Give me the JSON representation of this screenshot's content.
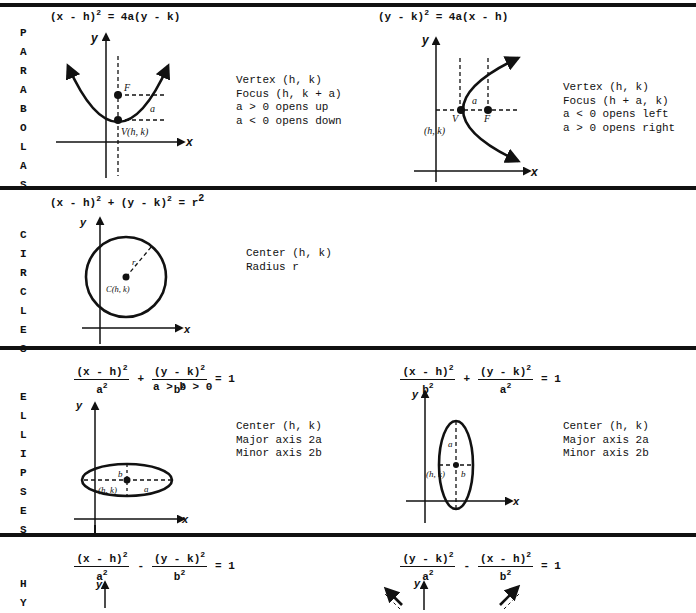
{
  "rules_y": [
    4,
    187,
    347,
    534
  ],
  "parabolas": {
    "side_label": [
      "P",
      "A",
      "R",
      "A",
      "B",
      "O",
      "L",
      "A",
      "S"
    ],
    "vertical": {
      "equation": {
        "lhs_base": "(x - h)",
        "lhs_exp": "2",
        "rhs": " = 4a(y - k)"
      },
      "notes": [
        "Vertex (h, k)",
        "Focus (h, k + a)",
        "a > 0 opens up",
        "a < 0 opens down"
      ],
      "labels": {
        "y": "y",
        "x": "x",
        "focus": "F",
        "a": "a",
        "vertex": "V(h, k)"
      }
    },
    "horizontal": {
      "equation": {
        "lhs_base": "(y - k)",
        "lhs_exp": "2",
        "rhs": " = 4a(x - h)"
      },
      "notes": [
        "Vertex (h, k)",
        "Focus (h + a, k)",
        "a < 0 opens left",
        "a > 0 opens right"
      ],
      "labels": {
        "y": "y",
        "x": "x",
        "vertex": "V",
        "focus": "F",
        "a": "a",
        "vertex_coords": "(h, k)"
      }
    }
  },
  "circles": {
    "side_label": [
      "C",
      "I",
      "R",
      "C",
      "L",
      "E",
      "S"
    ],
    "equation": {
      "t1": "(x - h)",
      "e1": "2",
      "plus": " + ",
      "t2": "(y - k)",
      "e2": "2",
      "eq": " = r",
      "e3": "2"
    },
    "notes": [
      "Center (h, k)",
      "Radius r"
    ],
    "labels": {
      "y": "y",
      "x": "x",
      "radius": "r",
      "center": "C(h, k)"
    }
  },
  "ellipses": {
    "side_label": [
      "E",
      "L",
      "L",
      "I",
      "P",
      "S",
      "E",
      "S"
    ],
    "horizontal": {
      "equation": {
        "num1": "(x - h)",
        "num1_exp": "2",
        "den1": "a",
        "den1_exp": "2",
        "op": "+",
        "num2": "(y - k)",
        "num2_exp": "2",
        "den2": "b",
        "den2_exp": "2",
        "rhs": "= 1"
      },
      "condition": "a > b > 0",
      "notes": [
        "Center (h, k)",
        "Major axis 2a",
        "Minor axis 2b"
      ],
      "labels": {
        "y": "y",
        "x": "x",
        "b": "b",
        "a": "a",
        "center": "(h, k)"
      }
    },
    "vertical": {
      "equation": {
        "num1": "(x - h)",
        "num1_exp": "2",
        "den1": "b",
        "den1_exp": "2",
        "op": "+",
        "num2": "(y - k)",
        "num2_exp": "2",
        "den2": "a",
        "den2_exp": "2",
        "rhs": "= 1"
      },
      "notes": [
        "Center (h, k)",
        "Major axis 2a",
        "Minor axis 2b"
      ],
      "labels": {
        "y": "y",
        "x": "x",
        "a": "a",
        "b": "b",
        "center": "(h, k)"
      }
    }
  },
  "hyperbolas": {
    "side_label": [
      "H",
      "Y"
    ],
    "horizontal": {
      "equation": {
        "num1": "(x - h)",
        "num1_exp": "2",
        "den1": "a",
        "den1_exp": "2",
        "op": "-",
        "num2": "(y - k)",
        "num2_exp": "2",
        "den2": "b",
        "den2_exp": "2",
        "rhs": "= 1"
      },
      "labels": {
        "y": "y"
      }
    },
    "vertical": {
      "equation": {
        "num1": "(y - k)",
        "num1_exp": "2",
        "den1": "a",
        "den1_exp": "2",
        "op": "-",
        "num2": "(x - h)",
        "num2_exp": "2",
        "den2": "b",
        "den2_exp": "2",
        "rhs": "= 1"
      },
      "labels": {
        "y": "y"
      }
    }
  }
}
